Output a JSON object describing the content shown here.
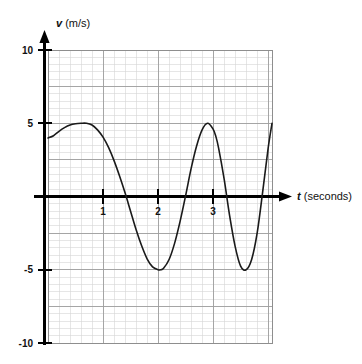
{
  "figure": {
    "name": "velocity-time-graph",
    "background_color": "#ffffff",
    "curve_color": "#1a1a1a",
    "axis_color": "#000000",
    "grid_minor_color": "#d4d4d4",
    "grid_major_color": "#9a9a9a"
  },
  "axes": {
    "y_axis_label_var": "v",
    "y_axis_label_unit": " (m/s)",
    "x_axis_label_var": "t",
    "x_axis_label_unit": " (seconds)"
  },
  "ticks": {
    "y": [
      {
        "value": 10,
        "label": "10"
      },
      {
        "value": 5,
        "label": "5"
      },
      {
        "value": -5,
        "label": "-5"
      },
      {
        "value": -10,
        "label": "-10"
      }
    ],
    "x": [
      {
        "value": 1,
        "label": "1"
      },
      {
        "value": 2,
        "label": "2"
      },
      {
        "value": 3,
        "label": "3"
      }
    ]
  },
  "chart_data": {
    "type": "line",
    "title": "",
    "subtitle": "",
    "xlabel": "t (seconds)",
    "ylabel": "v (m/s)",
    "xlim": [
      0,
      4.07
    ],
    "ylim": [
      -10,
      10
    ],
    "grid": true,
    "grid_major_step_x": 1,
    "grid_major_step_y": 2.5,
    "grid_minor_step_x": 0.2,
    "grid_minor_step_y": 0.5,
    "legend": null,
    "legend_position": "none",
    "xticks": [
      1,
      2,
      3
    ],
    "yticks": [
      10,
      5,
      -5,
      -10
    ],
    "annotations": [],
    "series": [
      {
        "name": "velocity",
        "color": "#1a1a1a",
        "line_width": 1.6,
        "x": [
          0.0,
          0.1,
          0.2,
          0.3,
          0.4,
          0.5,
          0.6,
          0.7,
          0.8,
          0.9,
          1.0,
          1.1,
          1.2,
          1.3,
          1.4,
          1.5,
          1.6,
          1.7,
          1.8,
          1.9,
          2.0,
          2.05,
          2.1,
          2.2,
          2.3,
          2.4,
          2.5,
          2.6,
          2.7,
          2.8,
          2.9,
          3.0,
          3.05,
          3.1,
          3.2,
          3.3,
          3.4,
          3.5,
          3.6,
          3.7,
          3.8,
          3.9,
          4.0,
          4.07
        ],
        "y": [
          4.0,
          4.15,
          4.45,
          4.7,
          4.88,
          4.97,
          5.0,
          5.0,
          4.88,
          4.55,
          4.05,
          3.35,
          2.45,
          1.4,
          0.25,
          -1.0,
          -2.25,
          -3.35,
          -4.25,
          -4.8,
          -5.0,
          -5.0,
          -4.9,
          -4.3,
          -3.2,
          -1.7,
          0.05,
          1.9,
          3.45,
          4.55,
          5.0,
          4.6,
          4.1,
          3.3,
          1.2,
          -1.3,
          -3.4,
          -4.75,
          -5.0,
          -4.3,
          -2.5,
          0.3,
          3.3,
          5.0
        ],
        "description": "Velocity starts near 4 m/s, rises to a +5 m/s crest near t=0.7 s, then oscillates between +5 and -5 m/s with progressively increasing frequency"
      }
    ],
    "peaks": [
      {
        "t": 0.68,
        "v": 5
      },
      {
        "t": 2.93,
        "v": 5
      },
      {
        "t": 4.0,
        "v": 5
      }
    ],
    "troughs": [
      {
        "t": 2.03,
        "v": -5
      },
      {
        "t": 3.63,
        "v": -5
      }
    ],
    "zero_crossings": [
      1.38,
      2.49,
      3.27,
      3.9
    ]
  }
}
